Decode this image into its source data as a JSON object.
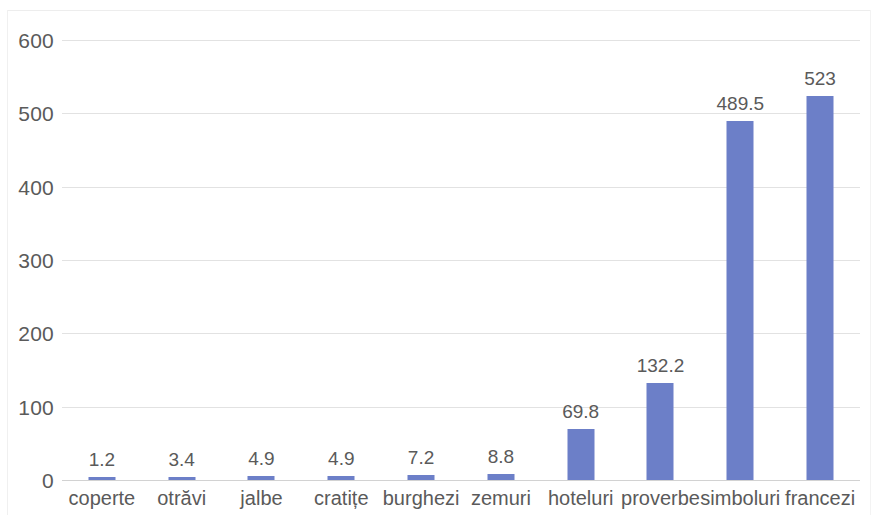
{
  "chart_data": {
    "type": "bar",
    "title": "",
    "subtitle": "",
    "xlabel": "",
    "ylabel": "",
    "categories": [
      "coperte",
      "otrăvi",
      "jalbe",
      "cratițe",
      "burghezi",
      "zemuri",
      "hoteluri",
      "proverbe",
      "simboluri",
      "francezi"
    ],
    "values": [
      1.2,
      3.4,
      4.9,
      4.9,
      7.2,
      8.8,
      69.8,
      132.2,
      489.5,
      523
    ],
    "value_labels": [
      "1.2",
      "3.4",
      "4.9",
      "4.9",
      "7.2",
      "8.8",
      "69.8",
      "132.2",
      "489.5",
      "523"
    ],
    "ylim": [
      0,
      600
    ],
    "y_ticks": [
      0,
      100,
      200,
      300,
      400,
      500,
      600
    ],
    "y_tick_labels": [
      "0",
      "100",
      "200",
      "300",
      "400",
      "500",
      "600"
    ],
    "grid": true,
    "grid_axis": "y",
    "legend": false,
    "legend_position": "none",
    "data_labels": true,
    "bar_color": "#6C7FC8",
    "text_color": "#5A5A5A",
    "gridline_color": "#E2E2E2",
    "background_color": "#FFFFFF"
  }
}
